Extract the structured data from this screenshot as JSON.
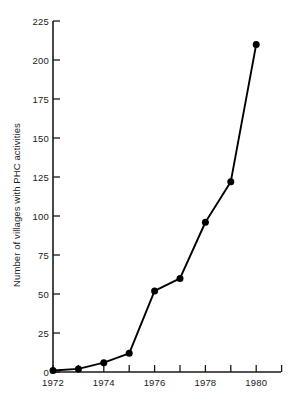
{
  "chart_data": {
    "type": "line",
    "title": "",
    "subtitle": "",
    "xlabel": "",
    "ylabel": "Number of villages with PHC activities",
    "x": [
      1972,
      1973,
      1974,
      1975,
      1976,
      1977,
      1978,
      1979,
      1980
    ],
    "values": [
      1,
      2,
      6,
      12,
      52,
      60,
      96,
      122,
      210
    ],
    "series": [
      {
        "name": "Villages with PHC activities",
        "values": [
          1,
          2,
          6,
          12,
          52,
          60,
          96,
          122,
          210
        ]
      }
    ],
    "xlim": [
      1972,
      1981
    ],
    "ylim": [
      0,
      225
    ],
    "ytick_labels": [
      "0",
      "25",
      "50",
      "75",
      "100",
      "125",
      "150",
      "175",
      "200",
      "225"
    ],
    "ytick_values": [
      0,
      25,
      50,
      75,
      100,
      125,
      150,
      175,
      200,
      225
    ],
    "xtick_values": [
      1972,
      1973,
      1974,
      1975,
      1976,
      1977,
      1978,
      1979,
      1980,
      1981
    ],
    "xtick_labels": [
      "1972",
      "",
      "1974",
      "",
      "1976",
      "",
      "1978",
      "",
      "1980",
      ""
    ],
    "grid": false,
    "legend": "none",
    "marker": "filled-circle",
    "line_color": "#000000",
    "marker_color": "#000000",
    "axis_color": "#1a1a1a",
    "background_color": "#ffffff"
  }
}
